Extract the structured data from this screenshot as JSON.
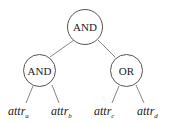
{
  "diagram": {
    "type": "access-tree",
    "root": {
      "label": "AND"
    },
    "internal": [
      {
        "label": "AND"
      },
      {
        "label": "OR"
      }
    ],
    "leaves": [
      {
        "base": "attr",
        "sub": "a"
      },
      {
        "base": "attr",
        "sub": "b"
      },
      {
        "base": "attr",
        "sub": "c"
      },
      {
        "base": "attr",
        "sub": "d"
      }
    ],
    "edges": [
      [
        "AND(root)",
        "AND"
      ],
      [
        "AND(root)",
        "OR"
      ],
      [
        "AND",
        "attr_a"
      ],
      [
        "AND",
        "attr_b"
      ],
      [
        "OR",
        "attr_c"
      ],
      [
        "OR",
        "attr_d"
      ]
    ],
    "colors": {
      "stroke": "#555555",
      "text": "#222222",
      "background": "#ffffff"
    }
  }
}
